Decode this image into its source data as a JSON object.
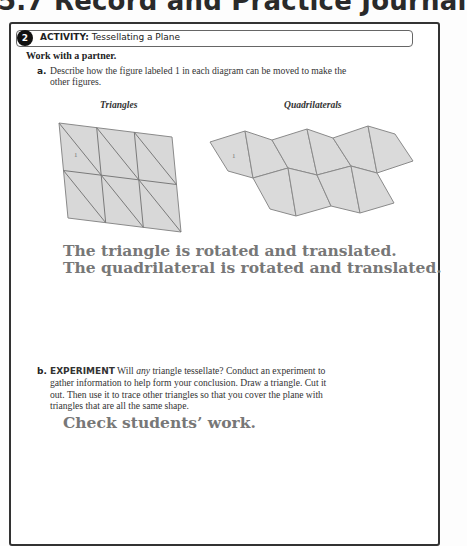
{
  "page": {
    "title": "5.7 Record and Practice Journal"
  },
  "activity": {
    "number": "2",
    "label": "ACTIVITY:",
    "title": "Tessellating a Plane"
  },
  "intro": "Work with a partner.",
  "part_a": {
    "letter": "a.",
    "question": "Describe how the figure labeled 1 in each diagram can be moved to make the other figures.",
    "captions": {
      "left": "Triangles",
      "right": "Quadrilaterals"
    },
    "figure_label": "1",
    "answer_line1": "The triangle is rotated and translated.",
    "answer_line2": "The quadrilateral is rotated and translated."
  },
  "part_b": {
    "letter": "b.",
    "keyword": "EXPERIMENT",
    "question_pre": " Will ",
    "question_em": "any",
    "question_post": " triangle tessellate? Conduct an experiment to gather information to help form your conclusion. Draw a triangle. Cut it out. Then use it to trace other triangles so that you cover the plane with triangles that are all the same shape.",
    "answer": "Check students’ work."
  },
  "colors": {
    "answer_text": "#777777",
    "shape_fill": "#d8d8d8",
    "shape_stroke": "#8a8a8a",
    "border": "#333333"
  }
}
